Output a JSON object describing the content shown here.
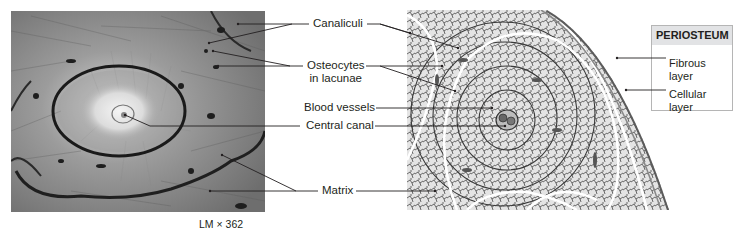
{
  "figure": {
    "photo": {
      "description": "Light micrograph of compact bone osteon",
      "magnification": "LM × 362"
    },
    "drawing": {
      "description": "Illustration of osteons with periosteum"
    },
    "center_labels": [
      {
        "id": "canaliculi",
        "text": "Canaliculi"
      },
      {
        "id": "osteocytes",
        "line1": "Osteocytes",
        "line2": "in lacunae"
      },
      {
        "id": "blood-vessels",
        "text": "Blood vessels"
      },
      {
        "id": "central-canal",
        "text": "Central canal"
      },
      {
        "id": "matrix",
        "text": "Matrix"
      }
    ],
    "periosteum": {
      "title": "PERIOSTEUM",
      "items": [
        {
          "line1": "Fibrous",
          "line2": "layer"
        },
        {
          "line1": "Cellular",
          "line2": "layer"
        }
      ]
    }
  }
}
